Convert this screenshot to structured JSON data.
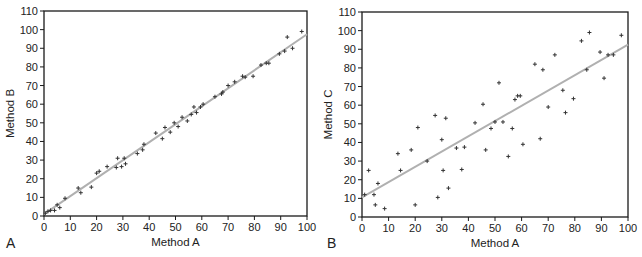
{
  "chart_data": [
    {
      "type": "scatter",
      "panel_label": "A",
      "title": "",
      "xlabel": "Method A",
      "ylabel": "Method B",
      "xlim": [
        0,
        100
      ],
      "ylim": [
        0,
        110
      ],
      "xticks": [
        0,
        10,
        20,
        30,
        40,
        50,
        60,
        70,
        80,
        90,
        100
      ],
      "yticks": [
        0,
        10,
        20,
        30,
        40,
        50,
        60,
        70,
        80,
        90,
        100,
        110
      ],
      "grid": false,
      "legend": null,
      "marker": "+",
      "regression_line": {
        "x": [
          0,
          100
        ],
        "y": [
          1,
          97.5
        ],
        "color": "#b0b0b0"
      },
      "points": [
        [
          0.5,
          1.5
        ],
        [
          1.5,
          2.5
        ],
        [
          2.5,
          3
        ],
        [
          4,
          3
        ],
        [
          5,
          6
        ],
        [
          6,
          4.5
        ],
        [
          8,
          9.5
        ],
        [
          13,
          15
        ],
        [
          14,
          12.5
        ],
        [
          18,
          15.5
        ],
        [
          20,
          23
        ],
        [
          21,
          24
        ],
        [
          24,
          26.5
        ],
        [
          27.5,
          26
        ],
        [
          28,
          31
        ],
        [
          29.5,
          26.5
        ],
        [
          30.5,
          31
        ],
        [
          31,
          28
        ],
        [
          35.5,
          33.5
        ],
        [
          37.5,
          35.5
        ],
        [
          38,
          38.5
        ],
        [
          42.5,
          44.5
        ],
        [
          45,
          41.5
        ],
        [
          46,
          47.5
        ],
        [
          48,
          45
        ],
        [
          49.5,
          50
        ],
        [
          51,
          48
        ],
        [
          52.5,
          53
        ],
        [
          54.5,
          51
        ],
        [
          56,
          54.5
        ],
        [
          57,
          58.5
        ],
        [
          58,
          55.5
        ],
        [
          59.5,
          58.5
        ],
        [
          60.5,
          60
        ],
        [
          65,
          64
        ],
        [
          67.5,
          65.5
        ],
        [
          68,
          66.5
        ],
        [
          70,
          70
        ],
        [
          72.5,
          72
        ],
        [
          75.5,
          75
        ],
        [
          76.5,
          74.5
        ],
        [
          79.5,
          75
        ],
        [
          82.5,
          81
        ],
        [
          84.5,
          82
        ],
        [
          85.5,
          82
        ],
        [
          89.5,
          87
        ],
        [
          91.5,
          88.5
        ],
        [
          92.5,
          96
        ],
        [
          94.5,
          90
        ],
        [
          98,
          99
        ]
      ]
    },
    {
      "type": "scatter",
      "panel_label": "B",
      "title": "",
      "xlabel": "Method A",
      "ylabel": "Method C",
      "xlim": [
        0,
        100
      ],
      "ylim": [
        0,
        110
      ],
      "xticks": [
        0,
        10,
        20,
        30,
        40,
        50,
        60,
        70,
        80,
        90,
        100
      ],
      "yticks": [
        0,
        10,
        20,
        30,
        40,
        50,
        60,
        70,
        80,
        90,
        100,
        110
      ],
      "grid": false,
      "legend": null,
      "marker": "+",
      "regression_line": {
        "x": [
          0,
          100
        ],
        "y": [
          10.5,
          92.5
        ],
        "color": "#b0b0b0"
      },
      "points": [
        [
          1,
          12
        ],
        [
          2.5,
          25
        ],
        [
          4.5,
          12
        ],
        [
          5,
          6.5
        ],
        [
          6,
          18
        ],
        [
          8.5,
          4.5
        ],
        [
          13.5,
          34
        ],
        [
          14.5,
          25
        ],
        [
          18.5,
          36
        ],
        [
          20,
          6.5
        ],
        [
          21,
          48
        ],
        [
          24.5,
          30
        ],
        [
          27.5,
          54.5
        ],
        [
          28.5,
          10.5
        ],
        [
          30,
          41.5
        ],
        [
          30.5,
          25
        ],
        [
          31.5,
          53
        ],
        [
          32.5,
          15.5
        ],
        [
          35.5,
          37
        ],
        [
          37.5,
          25.5
        ],
        [
          38.5,
          37.5
        ],
        [
          42.5,
          50.5
        ],
        [
          45.5,
          60.5
        ],
        [
          46.5,
          36
        ],
        [
          48.5,
          47.5
        ],
        [
          50,
          51
        ],
        [
          51.5,
          72
        ],
        [
          53,
          51
        ],
        [
          55,
          32.5
        ],
        [
          56.5,
          47.5
        ],
        [
          57.5,
          63
        ],
        [
          58.5,
          65
        ],
        [
          59.5,
          65
        ],
        [
          60.5,
          39
        ],
        [
          65,
          82
        ],
        [
          67,
          42
        ],
        [
          68,
          79
        ],
        [
          70,
          59
        ],
        [
          72.5,
          87
        ],
        [
          75.5,
          68
        ],
        [
          76.5,
          56
        ],
        [
          79.5,
          63.5
        ],
        [
          82.5,
          94.5
        ],
        [
          84.5,
          79
        ],
        [
          85.5,
          99
        ],
        [
          89.5,
          88.5
        ],
        [
          91,
          74.5
        ],
        [
          92.5,
          87
        ],
        [
          94.5,
          87
        ],
        [
          97.5,
          97.5
        ]
      ]
    }
  ],
  "caption_fragment": "Figure 7-1"
}
